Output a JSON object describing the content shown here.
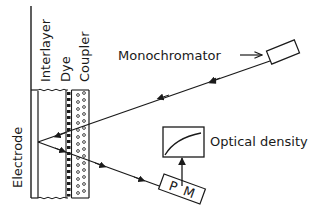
{
  "diagram": {
    "layers": {
      "electrode": "Electrode",
      "interlayer": "Interlayer",
      "dye": "Dye",
      "coupler": "Coupler"
    },
    "components": {
      "monochromator": "Monochromator",
      "optical_density": "Optical density",
      "photomultiplier_p": "P",
      "photomultiplier_m": "M"
    },
    "colors": {
      "ink": "#1a1a1a",
      "background": "#ffffff"
    }
  }
}
